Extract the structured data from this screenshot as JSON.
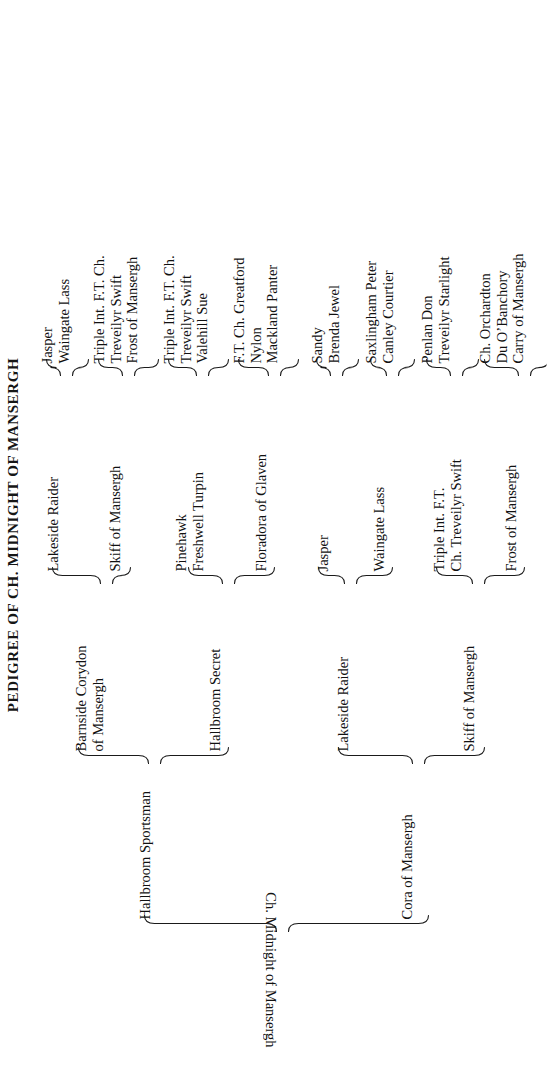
{
  "header": {
    "title": "PEDIGREE OF CH. MIDNIGHT OF MANSERGH"
  },
  "pedigree": {
    "root": {
      "name": "Ch. Midnight of Mansergh"
    },
    "generation_1": [
      {
        "name": "Hallbroom Sportsman"
      },
      {
        "name": "Cora of Mansergh"
      }
    ],
    "generation_2": [
      {
        "name": "Barnside Corydon\nof Mansergh",
        "line1": "Barnside Corydon",
        "line2": "of Mansergh"
      },
      {
        "name": "Hallbroom Secret",
        "line1": "Hallbroom Secret",
        "line2": ""
      },
      {
        "name": "Lakeside Raider",
        "line1": "Lakeside Raider",
        "line2": ""
      },
      {
        "name": "Skiff of Mansergh",
        "line1": "Skiff of Mansergh",
        "line2": ""
      }
    ],
    "generation_3": [
      {
        "line1": "Lakeside Raider",
        "line2": ""
      },
      {
        "line1": "Skiff of Mansergh",
        "line2": ""
      },
      {
        "line1": "Pinehawk",
        "line2": "Freshwell Turpin"
      },
      {
        "line1": "Floradora of Glaven",
        "line2": ""
      },
      {
        "line1": "Jasper",
        "line2": ""
      },
      {
        "line1": "Waingate Lass",
        "line2": ""
      },
      {
        "line1": "Triple Int. F.T.",
        "line2": "Ch. Treveilyr Swift"
      },
      {
        "line1": "Frost of Mansergh",
        "line2": ""
      }
    ],
    "generation_4": [
      {
        "lines": [
          "Jasper",
          "Waingate Lass"
        ]
      },
      {
        "lines": [
          "Triple Int. F.T. Ch.",
          "Treveilyr Swift",
          "Frost of Mansergh"
        ]
      },
      {
        "lines": [
          "Triple Int. F.T. Ch.",
          "Treveilyr Swift",
          "Valehill Sue"
        ]
      },
      {
        "lines": [
          "F.T. Ch. Greatford",
          "Nylon",
          "Mackland Panter"
        ]
      },
      {
        "lines": [
          "Sandy",
          "Brenda Jewel"
        ]
      },
      {
        "lines": [
          "Saxlingham Peter",
          "Canley Courtier"
        ]
      },
      {
        "lines": [
          "Penlan Don",
          "Treveilyr Starlight"
        ]
      },
      {
        "lines": [
          "Ch. Orchardton",
          "Du O’Banchory",
          "Carry of Mansergh"
        ]
      }
    ]
  }
}
